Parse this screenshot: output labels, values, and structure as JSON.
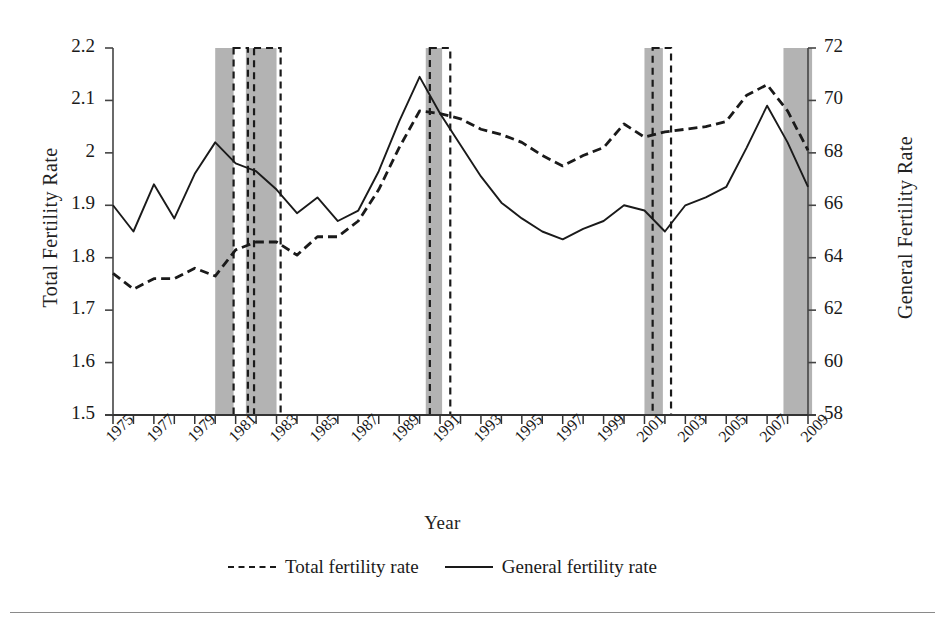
{
  "chart_data": {
    "type": "line",
    "title": "",
    "xlabel": "Year",
    "ylabel": "Total Fertility Rate",
    "y2label": "General Fertility Rate",
    "ylim": [
      1.5,
      2.2
    ],
    "y2lim": [
      58,
      72
    ],
    "xlim": [
      1975,
      2009
    ],
    "grid": false,
    "legend_position": "bottom",
    "yticks": [
      "1.5",
      "1.6",
      "1.7",
      "1.8",
      "1.9",
      "2",
      "2.1",
      "2.2"
    ],
    "y2ticks": [
      "58",
      "60",
      "62",
      "64",
      "66",
      "68",
      "70",
      "72"
    ],
    "xticks": [
      "1975",
      "1977",
      "1979",
      "1981",
      "1983",
      "1985",
      "1987",
      "1989",
      "1991",
      "1993",
      "1995",
      "1997",
      "1999",
      "2001",
      "2003",
      "2005",
      "2007",
      "2009"
    ],
    "x": [
      1975,
      1976,
      1977,
      1978,
      1979,
      1980,
      1981,
      1982,
      1983,
      1984,
      1985,
      1986,
      1987,
      1988,
      1989,
      1990,
      1991,
      1992,
      1993,
      1994,
      1995,
      1996,
      1997,
      1998,
      1999,
      2000,
      2001,
      2002,
      2003,
      2004,
      2005,
      2006,
      2007,
      2008,
      2009
    ],
    "series": [
      {
        "name": "Total fertility rate",
        "axis": "left",
        "style": "dashed",
        "color": "#1a1a1a",
        "values": [
          1.77,
          1.74,
          1.76,
          1.76,
          1.78,
          1.765,
          1.815,
          1.83,
          1.83,
          1.805,
          1.84,
          1.84,
          1.87,
          1.93,
          2.01,
          2.08,
          2.075,
          2.065,
          2.045,
          2.035,
          2.02,
          1.995,
          1.975,
          1.995,
          2.01,
          2.055,
          2.03,
          2.04,
          2.045,
          2.05,
          2.06,
          2.11,
          2.13,
          2.08,
          2.005
        ]
      },
      {
        "name": "General fertility rate",
        "axis": "right",
        "style": "solid",
        "color": "#1a1a1a",
        "values": [
          66.0,
          65.0,
          66.8,
          65.5,
          67.2,
          68.4,
          67.6,
          67.3,
          66.6,
          65.7,
          66.3,
          65.4,
          65.8,
          67.3,
          69.2,
          70.9,
          69.5,
          68.3,
          67.1,
          66.1,
          65.5,
          65.0,
          64.7,
          65.1,
          65.4,
          66.0,
          65.8,
          65.0,
          66.0,
          66.3,
          66.7,
          68.2,
          69.8,
          68.4,
          66.7
        ]
      }
    ],
    "recession_bands": [
      {
        "start": 1980.0,
        "end": 1980.9
      },
      {
        "start": 1981.5,
        "end": 1983.0
      },
      {
        "start": 1990.3,
        "end": 1991.1
      },
      {
        "start": 2001.0,
        "end": 2001.9
      },
      {
        "start": 2007.8,
        "end": 2009.2
      }
    ],
    "dashed_boxes": [
      {
        "start": 1980.9,
        "end": 1981.6
      },
      {
        "start": 1981.9,
        "end": 1983.2
      },
      {
        "start": 1990.5,
        "end": 1991.5
      },
      {
        "start": 2001.4,
        "end": 2002.3
      }
    ],
    "band_color": "#b3b3b3"
  },
  "legend": {
    "items": [
      {
        "label": "Total fertility rate",
        "style": "dashed"
      },
      {
        "label": "General fertility rate",
        "style": "solid"
      }
    ]
  }
}
